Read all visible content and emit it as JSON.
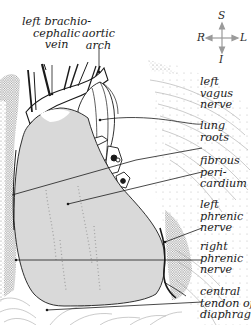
{
  "diagram": {
    "type": "anatomical-illustration",
    "colors": {
      "pericardium_fill": "#d9d9d9",
      "outline": "#1a1a1a",
      "compass_arrow": "#9a9a9a",
      "background": "#ffffff",
      "stipple": "#8c8c8c"
    }
  },
  "labels": {
    "left_brachiocephalic_vein": {
      "lines": [
        "left brachio-",
        "cephalic",
        "vein"
      ]
    },
    "aortic_arch": {
      "lines": [
        "aortic",
        "arch"
      ]
    },
    "left_vagus_nerve": {
      "lines": [
        "left",
        "vagus",
        "nerve"
      ]
    },
    "lung_roots": {
      "lines": [
        "lung",
        "roots"
      ]
    },
    "fibrous_pericardium": {
      "lines": [
        "fibrous",
        "peri-",
        "cardium"
      ]
    },
    "left_phrenic_nerve": {
      "lines": [
        "left",
        "phrenic",
        "nerve"
      ]
    },
    "right_phrenic_nerve": {
      "lines": [
        "right",
        "phrenic",
        "nerve"
      ]
    },
    "central_tendon": {
      "lines": [
        "central",
        "tendon of",
        "diaphragm"
      ]
    }
  },
  "compass": {
    "superior": "S",
    "inferior": "I",
    "right": "R",
    "left": "L"
  }
}
